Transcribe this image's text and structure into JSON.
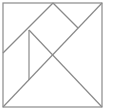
{
  "diagram": {
    "type": "tangram",
    "stroke_color": "#8a8a8a",
    "background": "#ffffff",
    "outer_square": {
      "x1": 3,
      "y1": 3,
      "x2": 102,
      "y2": 107
    },
    "segments": [
      {
        "name": "main-diagonal",
        "x1": 3,
        "y1": 107,
        "x2": 102,
        "y2": 3
      },
      {
        "name": "cross-diagonal",
        "x1": 29,
        "y1": 30,
        "x2": 102,
        "y2": 107
      },
      {
        "name": "parallelogram-left-edge",
        "x1": 3,
        "y1": 53,
        "x2": 53,
        "y2": 3
      },
      {
        "name": "square-right-edge",
        "x1": 53,
        "y1": 3,
        "x2": 78,
        "y2": 28
      },
      {
        "name": "vertical-edge",
        "x1": 29,
        "y1": 30,
        "x2": 29,
        "y2": 80
      }
    ]
  }
}
